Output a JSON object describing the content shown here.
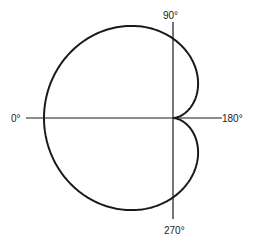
{
  "diagram": {
    "type": "polar-pattern",
    "pattern": "cardioid",
    "labels": {
      "top": "90°",
      "left": "0°",
      "right": "180°",
      "bottom": "270°"
    },
    "line_color": "#1a1a1a",
    "background": "#ffffff"
  }
}
